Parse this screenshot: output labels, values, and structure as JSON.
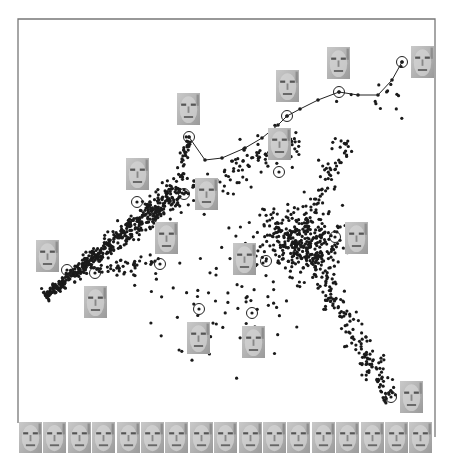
{
  "chart_data": {
    "type": "scatter",
    "title": "",
    "xlabel": "",
    "ylabel": "",
    "grid": false,
    "legend": null,
    "frame": {
      "left": 18,
      "top": 19,
      "right": 435,
      "bottom": 437,
      "color": "#777777"
    },
    "arms": [
      {
        "name": "main-diagonal",
        "from": [
          45,
          296
        ],
        "to": [
          180,
          190
        ],
        "count": 520,
        "spread": 4.5
      },
      {
        "name": "upper-arm",
        "from": [
          180,
          195
        ],
        "to": [
          300,
          140
        ],
        "count": 110,
        "spread": 9
      },
      {
        "name": "spur-to-top",
        "from": [
          178,
          180
        ],
        "to": [
          190,
          137
        ],
        "count": 35,
        "spread": 2.5
      },
      {
        "name": "lower-right-arm",
        "from": [
          305,
          245
        ],
        "to": [
          392,
          400
        ],
        "count": 190,
        "spread": 6
      },
      {
        "name": "right-vertical",
        "from": [
          300,
          235
        ],
        "to": [
          348,
          140
        ],
        "count": 70,
        "spread": 6
      },
      {
        "name": "middle-branch",
        "from": [
          90,
          268
        ],
        "to": [
          160,
          265
        ],
        "count": 45,
        "spread": 4
      }
    ],
    "clusters": [
      {
        "name": "central-blob",
        "center": [
          298,
          240
        ],
        "count": 330,
        "sx": 22,
        "sy": 16
      },
      {
        "name": "lower-middle-scatter",
        "center": [
          230,
          300
        ],
        "count": 80,
        "sx": 45,
        "sy": 30
      },
      {
        "name": "sparse-top-right",
        "center": [
          380,
          100
        ],
        "count": 14,
        "sx": 20,
        "sy": 14
      }
    ],
    "path": [
      [
        189,
        137
      ],
      [
        205,
        160
      ],
      [
        222,
        158
      ],
      [
        245,
        148
      ],
      [
        262,
        138
      ],
      [
        278,
        125
      ],
      [
        287,
        116
      ],
      [
        300,
        109
      ],
      [
        318,
        100
      ],
      [
        339,
        92
      ],
      [
        358,
        95
      ],
      [
        378,
        95
      ],
      [
        392,
        80
      ],
      [
        402,
        62
      ]
    ],
    "highlighted_points": [
      {
        "id": 1,
        "circle": [
          189,
          137
        ],
        "face": [
          177,
          93
        ]
      },
      {
        "id": 2,
        "circle": [
          137,
          202
        ],
        "face": [
          126,
          158
        ]
      },
      {
        "id": 3,
        "circle": [
          184,
          194
        ],
        "face": [
          195,
          178
        ]
      },
      {
        "id": 4,
        "circle": [
          287,
          116
        ],
        "face": [
          276,
          70
        ]
      },
      {
        "id": 5,
        "circle": [
          339,
          92
        ],
        "face": [
          327,
          47
        ]
      },
      {
        "id": 6,
        "circle": [
          402,
          62
        ],
        "face": [
          411,
          46
        ]
      },
      {
        "id": 7,
        "circle": [
          279,
          172
        ],
        "face": [
          268,
          128
        ]
      },
      {
        "id": 8,
        "circle": [
          67,
          270
        ],
        "face": [
          36,
          240
        ]
      },
      {
        "id": 9,
        "circle": [
          95,
          273
        ],
        "face": [
          84,
          286
        ]
      },
      {
        "id": 10,
        "circle": [
          160,
          264
        ],
        "face": [
          155,
          222
        ]
      },
      {
        "id": 11,
        "circle": [
          266,
          261
        ],
        "face": [
          233,
          243
        ]
      },
      {
        "id": 12,
        "circle": [
          335,
          237
        ],
        "face": [
          345,
          222
        ]
      },
      {
        "id": 13,
        "circle": [
          199,
          309
        ],
        "face": [
          187,
          322
        ]
      },
      {
        "id": 14,
        "circle": [
          252,
          313
        ],
        "face": [
          242,
          326
        ]
      },
      {
        "id": 15,
        "circle": [
          391,
          397
        ],
        "face": [
          400,
          381
        ]
      }
    ],
    "face_size": [
      23,
      32
    ],
    "frame_strip": {
      "y": 422,
      "x0": 19,
      "step": 24.4,
      "count": 17,
      "w": 23,
      "h": 31
    }
  }
}
